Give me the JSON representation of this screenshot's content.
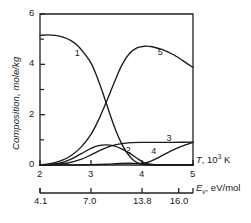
{
  "chart_data": {
    "type": "line",
    "title": "",
    "xlabel": "T, 10^3 K",
    "ylabel": "Composition, mole/kg",
    "xlim": [
      2,
      5
    ],
    "ylim": [
      0,
      6
    ],
    "grid": false,
    "legend_position": "inline-curve-labels",
    "y_ticks_major": [
      "0",
      "2",
      "4",
      "6"
    ],
    "y_ticks_major_values": [
      0,
      2,
      4,
      6
    ],
    "y_ticks_minor_values": [
      1,
      3,
      5
    ],
    "x_ticks_major": [
      "2",
      "3",
      "4",
      "5"
    ],
    "x_ticks_major_values": [
      2,
      3,
      4,
      5
    ],
    "secondary_axis": {
      "label": "E_v, eV/mol",
      "label_symbol": "E",
      "label_sub": "v",
      "label_unit": ", eV/mol",
      "ticks": [
        "4.1",
        "7.0",
        "13.8",
        "16.0"
      ],
      "tick_positions_in_T": [
        2,
        3,
        4,
        4.72
      ]
    },
    "axis_label_primary": {
      "symbol": "T",
      "unit": ", 10",
      "exponent": "3",
      "unit_tail": " K"
    },
    "series": [
      {
        "name": "1",
        "label": "1",
        "label_at": {
          "x": 2.72,
          "y": 4.42
        },
        "points": [
          [
            2.0,
            5.15
          ],
          [
            2.15,
            5.17
          ],
          [
            2.3,
            5.15
          ],
          [
            2.45,
            5.08
          ],
          [
            2.6,
            4.95
          ],
          [
            2.75,
            4.72
          ],
          [
            2.9,
            4.35
          ],
          [
            3.0,
            4.05
          ],
          [
            3.1,
            3.6
          ],
          [
            3.2,
            3.05
          ],
          [
            3.3,
            2.45
          ],
          [
            3.4,
            1.85
          ],
          [
            3.5,
            1.3
          ],
          [
            3.6,
            0.85
          ],
          [
            3.7,
            0.5
          ],
          [
            3.8,
            0.25
          ],
          [
            3.9,
            0.1
          ],
          [
            4.0,
            0.03
          ],
          [
            4.2,
            0.0
          ],
          [
            5.0,
            0.0
          ]
        ]
      },
      {
        "name": "2",
        "label": "2",
        "label_at": {
          "x": 3.72,
          "y": 0.55
        },
        "points": [
          [
            2.0,
            0.0
          ],
          [
            2.2,
            0.02
          ],
          [
            2.4,
            0.08
          ],
          [
            2.6,
            0.22
          ],
          [
            2.8,
            0.44
          ],
          [
            3.0,
            0.66
          ],
          [
            3.15,
            0.77
          ],
          [
            3.3,
            0.8
          ],
          [
            3.45,
            0.76
          ],
          [
            3.6,
            0.64
          ],
          [
            3.75,
            0.47
          ],
          [
            3.9,
            0.27
          ],
          [
            4.0,
            0.14
          ],
          [
            4.1,
            0.05
          ],
          [
            4.25,
            0.01
          ],
          [
            4.5,
            0.0
          ],
          [
            5.0,
            0.0
          ]
        ]
      },
      {
        "name": "3",
        "label": "3",
        "label_at": {
          "x": 4.52,
          "y": 1.03
        },
        "points": [
          [
            2.0,
            0.0
          ],
          [
            2.3,
            0.02
          ],
          [
            2.55,
            0.08
          ],
          [
            2.8,
            0.22
          ],
          [
            3.0,
            0.4
          ],
          [
            3.2,
            0.6
          ],
          [
            3.4,
            0.76
          ],
          [
            3.6,
            0.85
          ],
          [
            3.8,
            0.89
          ],
          [
            4.0,
            0.9
          ],
          [
            4.3,
            0.9
          ],
          [
            4.6,
            0.9
          ],
          [
            5.0,
            0.91
          ]
        ]
      },
      {
        "name": "4",
        "label": "4",
        "label_at": {
          "x": 4.22,
          "y": 0.53
        },
        "points": [
          [
            2.0,
            0.0
          ],
          [
            2.6,
            0.0
          ],
          [
            3.0,
            0.01
          ],
          [
            3.3,
            0.03
          ],
          [
            3.55,
            0.06
          ],
          [
            3.75,
            0.07
          ],
          [
            3.95,
            0.06
          ],
          [
            4.1,
            0.1
          ],
          [
            4.25,
            0.22
          ],
          [
            4.4,
            0.38
          ],
          [
            4.55,
            0.54
          ],
          [
            4.7,
            0.68
          ],
          [
            4.85,
            0.8
          ],
          [
            5.0,
            0.9
          ]
        ]
      },
      {
        "name": "5",
        "label": "5",
        "label_at": {
          "x": 4.35,
          "y": 4.45
        },
        "points": [
          [
            2.0,
            0.0
          ],
          [
            2.2,
            0.05
          ],
          [
            2.4,
            0.16
          ],
          [
            2.6,
            0.36
          ],
          [
            2.8,
            0.7
          ],
          [
            3.0,
            1.22
          ],
          [
            3.15,
            1.8
          ],
          [
            3.3,
            2.5
          ],
          [
            3.45,
            3.25
          ],
          [
            3.6,
            3.95
          ],
          [
            3.75,
            4.42
          ],
          [
            3.9,
            4.65
          ],
          [
            4.05,
            4.72
          ],
          [
            4.2,
            4.7
          ],
          [
            4.4,
            4.58
          ],
          [
            4.6,
            4.4
          ],
          [
            4.8,
            4.15
          ],
          [
            5.0,
            3.88
          ]
        ]
      }
    ]
  }
}
